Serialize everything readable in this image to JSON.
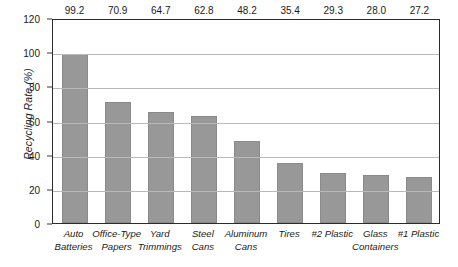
{
  "chart_data": {
    "type": "bar",
    "title": "",
    "xlabel": "",
    "ylabel": "Recycling Rate (%)",
    "ylim": [
      0,
      120
    ],
    "yticks": [
      0,
      20,
      40,
      60,
      80,
      100,
      120
    ],
    "ytick_labels": [
      "0",
      "20",
      "40",
      "60",
      "80",
      "100",
      "120"
    ],
    "grid": "horizontal",
    "legend": "none",
    "bar_color": "#989898",
    "categories": [
      "Auto Batteries",
      "Office-Type Papers",
      "Yard Trimmings",
      "Steel Cans",
      "Aluminum Cans",
      "Tires",
      "#2 Plastic",
      "Glass Containers",
      "#1 Plastic"
    ],
    "category_lines": [
      [
        "Auto",
        "Batteries"
      ],
      [
        "Office-Type",
        "Papers"
      ],
      [
        "Yard",
        "Trimmings"
      ],
      [
        "Steel",
        "Cans"
      ],
      [
        "Aluminum",
        "Cans"
      ],
      [
        "Tires",
        ""
      ],
      [
        "#2 Plastic",
        ""
      ],
      [
        "Glass",
        "Containers"
      ],
      [
        "#1 Plastic",
        ""
      ]
    ],
    "values": [
      99.2,
      70.9,
      64.7,
      62.8,
      48.2,
      35.4,
      29.3,
      28.0,
      27.2
    ],
    "value_labels": [
      "99.2",
      "70.9",
      "64.7",
      "62.8",
      "48.2",
      "35.4",
      "29.3",
      "28.0",
      "27.2"
    ]
  }
}
